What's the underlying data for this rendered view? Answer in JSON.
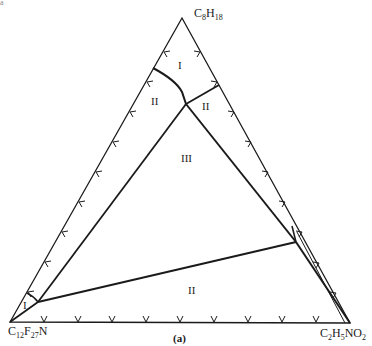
{
  "figure": {
    "corner_mark": "a",
    "caption": "(a)",
    "vertices": {
      "top": {
        "base": "C",
        "s1": "8",
        "m": "H",
        "s2": "18"
      },
      "left": {
        "base": "C",
        "s1": "12",
        "m": "F",
        "s2": "27",
        "tail": "N"
      },
      "right": {
        "base": "C",
        "s1": "2",
        "m": "H",
        "s2": "5",
        "tail": "NO",
        "s3": "2"
      }
    },
    "regions": [
      {
        "label": "I",
        "x": 178,
        "y": 62
      },
      {
        "label": "II",
        "x": 153,
        "y": 98
      },
      {
        "label": "II",
        "x": 202,
        "y": 103
      },
      {
        "label": "III",
        "x": 181,
        "y": 155
      },
      {
        "label": "II",
        "x": 188,
        "y": 284
      },
      {
        "label": "I",
        "x": 23,
        "y": 303
      }
    ],
    "colors": {
      "line": "#1a1a1a",
      "background": "#ffffff"
    }
  }
}
